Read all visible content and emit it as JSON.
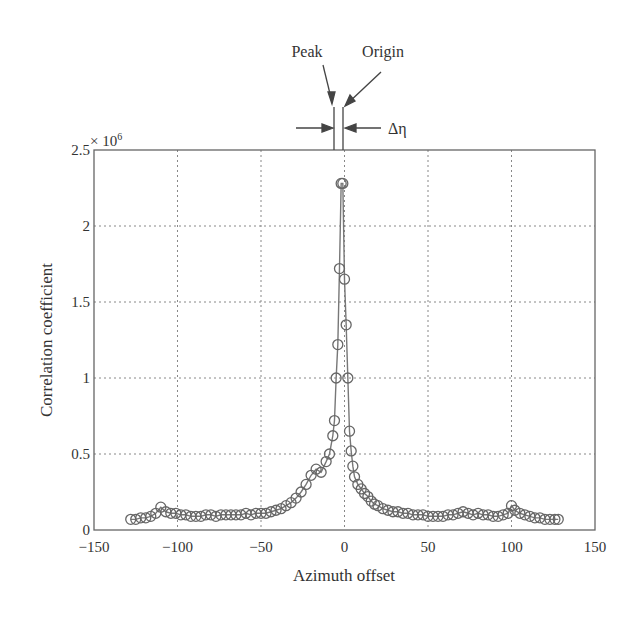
{
  "chart_data": {
    "type": "line",
    "title": "",
    "xlabel": "Azimuth offset",
    "ylabel": "Correlation coefficient",
    "y_multiplier_label": "× 10^6",
    "xlim": [
      -150,
      150
    ],
    "ylim": [
      0,
      2.5
    ],
    "xticks": [
      -150,
      -100,
      -50,
      0,
      50,
      100,
      150
    ],
    "xtick_labels": [
      "−150",
      "−100",
      "−50",
      "0",
      "50",
      "100",
      "150"
    ],
    "yticks": [
      0,
      0.5,
      1,
      1.5,
      2,
      2.5
    ],
    "ytick_labels": [
      "0",
      "0.5",
      "1",
      "1.5",
      "2",
      "2.5"
    ],
    "grid": true,
    "marker": "circle",
    "annotations": [
      {
        "text": "Peak",
        "x": -2
      },
      {
        "text": "Origin",
        "x": 0
      },
      {
        "text": "Δη",
        "meaning": "offset between peak and origin"
      }
    ],
    "series": [
      {
        "name": "correlation",
        "x": [
          -128,
          -125,
          -122,
          -119,
          -116,
          -113,
          -110,
          -107,
          -104,
          -101,
          -98,
          -95,
          -92,
          -89,
          -86,
          -83,
          -80,
          -77,
          -74,
          -71,
          -68,
          -65,
          -62,
          -59,
          -56,
          -53,
          -50,
          -47,
          -44,
          -41,
          -38,
          -35,
          -32,
          -29,
          -26,
          -23,
          -20,
          -17,
          -14,
          -11,
          -9,
          -7,
          -6,
          -5,
          -4,
          -3,
          -2,
          -1,
          0,
          1,
          2,
          3,
          4,
          5,
          6,
          8,
          10,
          12,
          14,
          16,
          18,
          20,
          23,
          26,
          29,
          32,
          35,
          38,
          41,
          44,
          47,
          50,
          53,
          56,
          59,
          62,
          65,
          68,
          71,
          74,
          77,
          80,
          83,
          86,
          89,
          92,
          95,
          98,
          100,
          102,
          105,
          108,
          111,
          114,
          117,
          120,
          123,
          126,
          128
        ],
        "values": [
          0.07,
          0.07,
          0.08,
          0.08,
          0.09,
          0.11,
          0.15,
          0.12,
          0.11,
          0.11,
          0.1,
          0.1,
          0.09,
          0.09,
          0.09,
          0.1,
          0.1,
          0.09,
          0.1,
          0.1,
          0.1,
          0.1,
          0.1,
          0.11,
          0.1,
          0.11,
          0.11,
          0.11,
          0.12,
          0.13,
          0.14,
          0.16,
          0.18,
          0.21,
          0.25,
          0.3,
          0.36,
          0.4,
          0.38,
          0.45,
          0.5,
          0.62,
          0.72,
          1.0,
          1.22,
          1.72,
          2.28,
          2.28,
          1.65,
          1.35,
          1.0,
          0.65,
          0.52,
          0.42,
          0.35,
          0.3,
          0.27,
          0.24,
          0.22,
          0.19,
          0.17,
          0.16,
          0.14,
          0.13,
          0.12,
          0.12,
          0.11,
          0.11,
          0.1,
          0.1,
          0.1,
          0.09,
          0.09,
          0.09,
          0.09,
          0.1,
          0.1,
          0.11,
          0.12,
          0.11,
          0.1,
          0.11,
          0.1,
          0.1,
          0.09,
          0.09,
          0.1,
          0.11,
          0.16,
          0.13,
          0.11,
          0.1,
          0.09,
          0.08,
          0.08,
          0.07,
          0.07,
          0.07,
          0.07
        ]
      }
    ]
  }
}
